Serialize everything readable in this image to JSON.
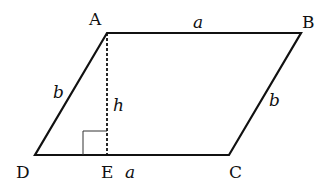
{
  "diagram": {
    "type": "parallelogram",
    "vertices": {
      "A": {
        "label": "A",
        "x": 107,
        "y": 33
      },
      "B": {
        "label": "B",
        "x": 301,
        "y": 33
      },
      "C": {
        "label": "C",
        "x": 229,
        "y": 155
      },
      "D": {
        "label": "D",
        "x": 35,
        "y": 155
      },
      "E": {
        "label": "E",
        "x": 107,
        "y": 155
      }
    },
    "side_labels": {
      "AB": "a",
      "DC": "a",
      "AD": "b",
      "BC": "b",
      "height": "h"
    },
    "right_angle_marker_at": "E",
    "line_color": "#111111"
  }
}
